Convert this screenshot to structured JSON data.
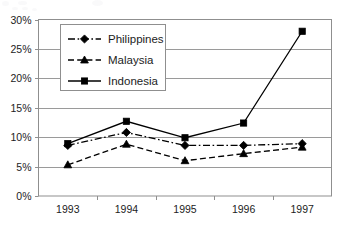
{
  "chart_data": {
    "type": "line",
    "title": "",
    "subtitle": "",
    "xlabel": "",
    "ylabel": "",
    "categories": [
      "1993",
      "1994",
      "1995",
      "1996",
      "1997"
    ],
    "ylim": [
      0,
      30
    ],
    "yticks": [
      "0%",
      "5%",
      "10%",
      "15%",
      "20%",
      "25%",
      "30%"
    ],
    "ytick_values": [
      0,
      5,
      10,
      15,
      20,
      25,
      30
    ],
    "grid": "horizontal",
    "legend_position": "upper-left-inside",
    "series": [
      {
        "name": "Philippines",
        "values": [
          8.6,
          10.8,
          8.6,
          8.6,
          8.9
        ],
        "marker": "diamond",
        "line_style": "dash-dot",
        "color": "#000000"
      },
      {
        "name": "Malaysia",
        "values": [
          5.3,
          8.8,
          6.0,
          7.2,
          8.3
        ],
        "marker": "triangle",
        "line_style": "dashed",
        "color": "#000000"
      },
      {
        "name": "Indonesia",
        "values": [
          8.9,
          12.7,
          9.9,
          12.4,
          28.0
        ],
        "marker": "square",
        "line_style": "solid",
        "color": "#000000"
      }
    ]
  },
  "axis": {
    "gridline_color": "#9a9a9a",
    "frame_color": "#8f8f8f"
  }
}
